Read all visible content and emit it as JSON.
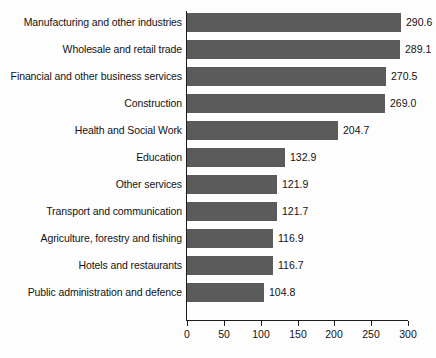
{
  "chart_data": {
    "type": "bar",
    "orientation": "horizontal",
    "title": "",
    "subtitle": "",
    "xlabel": "",
    "ylabel": "",
    "xlim": [
      0,
      300
    ],
    "xticks": [
      0,
      50,
      100,
      150,
      200,
      250,
      300
    ],
    "xtick_labels": [
      "0",
      "50",
      "100",
      "150",
      "200",
      "250",
      "300"
    ],
    "grid": false,
    "legend": null,
    "bar_color": "#5b5b5b",
    "axis_color": "#1c1c1c",
    "text_color": "#131313",
    "background_color": "#fdfdfd",
    "categories": [
      "Manufacturing and other industries",
      "Wholesale and retail trade",
      "Financial and other business services",
      "Construction",
      "Health and Social Work",
      "Education",
      "Other services",
      "Transport and communication",
      "Agriculture, forestry and fishing",
      "Hotels and restaurants",
      "Public administration and defence"
    ],
    "values": [
      290.6,
      289.1,
      270.5,
      269.0,
      204.7,
      132.9,
      121.9,
      121.7,
      116.9,
      116.7,
      104.8
    ],
    "value_labels": [
      "290.6",
      "289.1",
      "270.5",
      "269.0",
      "204.7",
      "132.9",
      "121.9",
      "121.7",
      "116.9",
      "116.7",
      "104.8"
    ]
  }
}
